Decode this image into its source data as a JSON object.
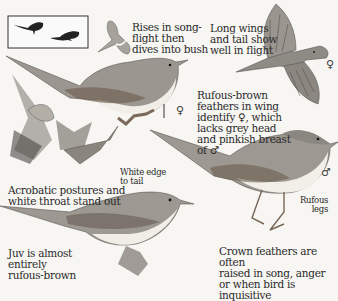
{
  "page": {
    "captions": {
      "song_flight": "Rises in song-flight then dives into bush",
      "song_flight_lines": [
        "Rises in song-",
        "flight then",
        "dives into bush"
      ],
      "long_wings": [
        "Long wings",
        "and tail show",
        "well in flight"
      ],
      "rufous_brown": [
        "Rufous-brown",
        "feathers in wing",
        "identify ♀, which",
        "lacks grey head",
        "and pinkish breast",
        "of ♂"
      ],
      "white_edge": [
        "White edge",
        "to tail"
      ],
      "acrobatic": [
        "Acrobatic postures and",
        "white throat stand out"
      ],
      "rufous_legs": [
        "Rufous",
        "legs"
      ],
      "juv": [
        "Juv is almost",
        "entirely",
        "rufous-brown"
      ],
      "crown": [
        "Crown feathers are often",
        "raised in song, anger",
        "or when bird is inquisitive"
      ]
    },
    "symbols": {
      "female_flight": "♀",
      "female_perched": "♀",
      "male": "♂"
    },
    "colors": {
      "background": "#f7f6f3",
      "bird_grey": "#8a8680",
      "bird_dark": "#4e4a45",
      "underpart": "#f2efe9",
      "rufous": "#8c6a50"
    }
  }
}
